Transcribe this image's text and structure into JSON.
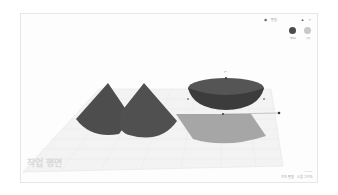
{
  "app": "3D design workplane",
  "topbar": {
    "view_icon": "home-view-icon",
    "label": "편집",
    "right_icons": [
      "lock-icon",
      "light-icon"
    ]
  },
  "shape_colors": {
    "solid": {
      "label": "솔리드",
      "color": "#4a4a4a"
    },
    "hole": {
      "label": "구멍",
      "color": "#c8c8c8"
    }
  },
  "left_panel": {
    "lines": [
      "",
      ""
    ]
  },
  "workplane": {
    "watermark": "작업 평면",
    "grid_color": "#dcdcdc",
    "plane_color": "#f2f2f2"
  },
  "objects": [
    {
      "type": "cone",
      "color": "#4d4d4d",
      "name": "cone-1"
    },
    {
      "type": "cone",
      "color": "#4d4d4d",
      "name": "cone-2"
    },
    {
      "type": "paraboloid",
      "color": "#4a4a4a",
      "name": "bowl",
      "selected": true
    }
  ],
  "footer": {
    "settings": "격자 편집",
    "snap": "스냅 그리드",
    "version": "1.0 mm"
  }
}
